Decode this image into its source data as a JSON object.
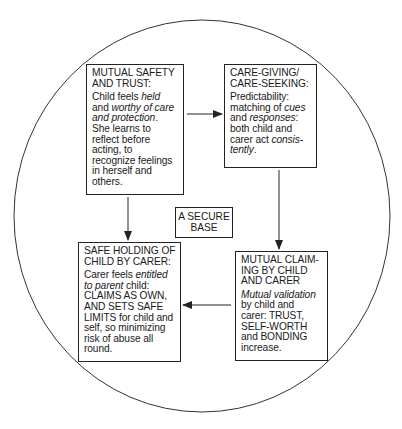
{
  "diagram": {
    "type": "cycle",
    "center_label": [
      "A SECURE",
      "BASE"
    ],
    "nodes": [
      {
        "id": "mutual-safety",
        "title": [
          "MUTUAL SAFETY",
          "AND TRUST:"
        ],
        "body_lines": [
          [
            {
              "t": "Child feels "
            },
            {
              "t": "held",
              "i": true
            }
          ],
          [
            {
              "t": "and "
            },
            {
              "t": "worthy of care",
              "i": true
            }
          ],
          [
            {
              "t": "and protection",
              "i": true
            },
            {
              "t": "."
            }
          ],
          [
            {
              "t": "She learns to"
            }
          ],
          [
            {
              "t": "reflect before"
            }
          ],
          [
            {
              "t": "acting, to"
            }
          ],
          [
            {
              "t": "recognize feelings"
            }
          ],
          [
            {
              "t": "in herself and"
            }
          ],
          [
            {
              "t": "others."
            }
          ]
        ]
      },
      {
        "id": "care-giving",
        "title": [
          "CARE-GIVING/",
          "CARE-SEEKING:"
        ],
        "body_lines": [
          [
            {
              "t": "Predictability:"
            }
          ],
          [
            {
              "t": "matching of "
            },
            {
              "t": "cues",
              "i": true
            }
          ],
          [
            {
              "t": "and "
            },
            {
              "t": "responses",
              "i": true
            },
            {
              "t": ":"
            }
          ],
          [
            {
              "t": "both child and"
            }
          ],
          [
            {
              "t": "carer act "
            },
            {
              "t": "consis-",
              "i": true
            }
          ],
          [
            {
              "t": "tently",
              "i": true
            },
            {
              "t": "."
            }
          ]
        ]
      },
      {
        "id": "mutual-claiming",
        "title": [
          "MUTUAL CLAIM-",
          "ING BY CHILD",
          "AND CARER"
        ],
        "body_lines": [
          [
            {
              "t": "Mutual validation",
              "i": true
            }
          ],
          [
            {
              "t": "by child and"
            }
          ],
          [
            {
              "t": "carer: TRUST,"
            }
          ],
          [
            {
              "t": "SELF-WORTH"
            }
          ],
          [
            {
              "t": "and BONDING"
            }
          ],
          [
            {
              "t": "increase."
            }
          ]
        ]
      },
      {
        "id": "safe-holding",
        "title": [
          "SAFE HOLDING OF",
          "CHILD BY CARER:"
        ],
        "body_lines": [
          [
            {
              "t": "Carer feels "
            },
            {
              "t": "entitled",
              "i": true
            }
          ],
          [
            {
              "t": "to parent",
              "i": true
            },
            {
              "t": " child:"
            }
          ],
          [
            {
              "t": "CLAIMS AS OWN,"
            }
          ],
          [
            {
              "t": "AND SETS SAFE"
            }
          ],
          [
            {
              "t": "LIMITS for child and"
            }
          ],
          [
            {
              "t": "self, so minimizing"
            }
          ],
          [
            {
              "t": "risk of abuse all"
            }
          ],
          [
            {
              "t": "round."
            }
          ]
        ]
      }
    ],
    "edges": [
      {
        "from": "mutual-safety",
        "to": "care-giving",
        "direction": "right"
      },
      {
        "from": "care-giving",
        "to": "mutual-claiming",
        "direction": "down"
      },
      {
        "from": "mutual-claiming",
        "to": "safe-holding",
        "direction": "left"
      },
      {
        "from": "mutual-safety",
        "to": "safe-holding",
        "direction": "down"
      }
    ],
    "colors": {
      "line": "#222222",
      "background": "#ffffff",
      "text": "#1a1a1a"
    }
  }
}
